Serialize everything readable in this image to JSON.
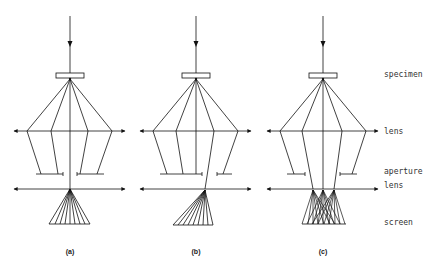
{
  "labels": {
    "specimen": "specimen",
    "lens_objective": "lens",
    "aperture": "aperture",
    "lens_projector": "lens",
    "screen": "screen"
  },
  "panels": [
    {
      "id": "a",
      "caption": "(a)",
      "cx": 70
    },
    {
      "id": "b",
      "caption": "(b)",
      "cx": 196
    },
    {
      "id": "c",
      "caption": "(c)",
      "cx": 323
    }
  ],
  "colors": {
    "line": "#111111",
    "text": "#333333"
  }
}
